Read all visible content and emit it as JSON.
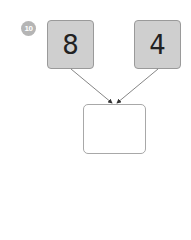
{
  "problem": {
    "number": "10",
    "left_value": "8",
    "right_value": "4",
    "answer_value": ""
  },
  "colors": {
    "badge": "#b5b5b5",
    "number_box_fill": "#cfcfcf",
    "number_box_border": "#9a9a9a",
    "arrow": "#555555"
  }
}
